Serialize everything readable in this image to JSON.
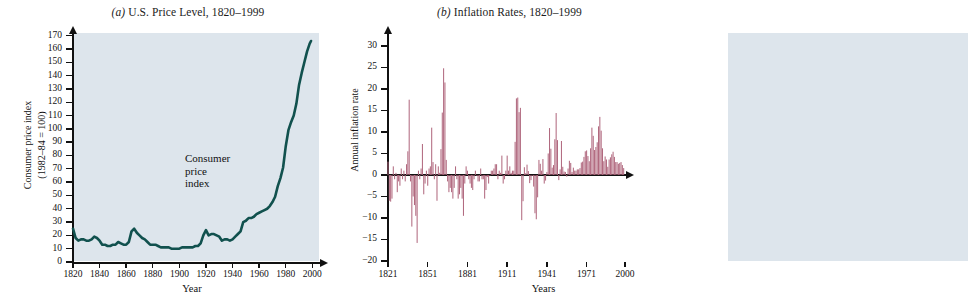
{
  "figure": {
    "panels": [
      {
        "id": "a",
        "label": "(a)",
        "title_italic": "(a)",
        "title_rest": " U.S. Price Level, 1820–1999"
      },
      {
        "id": "b",
        "label": "(b)",
        "title_italic": "(b)",
        "title_rest": " Inflation Rates, 1820–1999"
      }
    ],
    "colors": {
      "plot_background": "#dde5ec",
      "cpi_line": "#11514e",
      "bar_fill": "#b1697f",
      "axis": "#111111",
      "page_background": "#ffffff"
    }
  },
  "chart_data": [
    {
      "type": "line",
      "panel": "a",
      "title": "(a) U.S. Price Level, 1820–1999",
      "xlabel": "Year",
      "ylabel": "Consumer price index (1982–84 = 100)",
      "ylabel_line1": "Consumer price index",
      "ylabel_line2": "(1982–84 = 100)",
      "xlim": [
        1820,
        2005
      ],
      "ylim": [
        0,
        172
      ],
      "yticks": [
        0,
        10,
        20,
        30,
        40,
        50,
        60,
        70,
        80,
        90,
        100,
        110,
        120,
        130,
        140,
        150,
        160,
        170
      ],
      "xticks": [
        1820,
        1840,
        1860,
        1880,
        1900,
        1920,
        1940,
        1960,
        1980,
        2000
      ],
      "grid": false,
      "legend": "none",
      "annotations": [
        {
          "text_line1": "Consumer",
          "text_line2": "price",
          "text_line3": "index",
          "x": 1948,
          "y": 78
        }
      ],
      "series": [
        {
          "name": "Consumer price index",
          "color": "#11514e",
          "x": [
            1820,
            1822,
            1824,
            1826,
            1828,
            1830,
            1832,
            1834,
            1836,
            1838,
            1840,
            1842,
            1844,
            1846,
            1848,
            1850,
            1852,
            1854,
            1856,
            1858,
            1860,
            1862,
            1864,
            1866,
            1868,
            1870,
            1872,
            1874,
            1876,
            1878,
            1880,
            1882,
            1884,
            1886,
            1888,
            1890,
            1892,
            1894,
            1896,
            1898,
            1900,
            1902,
            1904,
            1906,
            1908,
            1910,
            1912,
            1914,
            1916,
            1918,
            1920,
            1922,
            1924,
            1926,
            1928,
            1930,
            1932,
            1934,
            1936,
            1938,
            1940,
            1942,
            1944,
            1946,
            1948,
            1950,
            1952,
            1954,
            1956,
            1958,
            1960,
            1962,
            1964,
            1966,
            1968,
            1970,
            1972,
            1974,
            1976,
            1978,
            1980,
            1982,
            1984,
            1986,
            1988,
            1990,
            1992,
            1994,
            1996,
            1998,
            1999
          ],
          "y": [
            25,
            18,
            16,
            17,
            17,
            16,
            16,
            17,
            19,
            18,
            16,
            13,
            13,
            12,
            12,
            13,
            13,
            15,
            14,
            13,
            13,
            15,
            23,
            25,
            22,
            20,
            18,
            17,
            15,
            13,
            13,
            13,
            12,
            11,
            11,
            11,
            11,
            10,
            10,
            10,
            10,
            11,
            11,
            11,
            11,
            11,
            12,
            12,
            14,
            20,
            24,
            20,
            21,
            21,
            20,
            19,
            16,
            17,
            17,
            16,
            17,
            19,
            21,
            23,
            30,
            31,
            33,
            33,
            34,
            36,
            37,
            38,
            39,
            40,
            42,
            45,
            49,
            57,
            63,
            71,
            87,
            99,
            105,
            110,
            119,
            133,
            142,
            150,
            158,
            164,
            166
          ],
          "note": "CPI 1982–84 = 100, biennial samples"
        }
      ]
    },
    {
      "type": "bar",
      "panel": "b",
      "title": "(b) Inflation Rates, 1820–1999",
      "xlabel": "Years",
      "ylabel": "Annual inflation rate",
      "xlim": [
        1821,
        2000
      ],
      "ylim": [
        -20,
        33
      ],
      "yticks": [
        -20,
        -15,
        -10,
        -5,
        0,
        5,
        10,
        15,
        20,
        25,
        30
      ],
      "xticks": [
        1821,
        1851,
        1881,
        1911,
        1941,
        1971,
        2000
      ],
      "grid": false,
      "legend": "none",
      "bar_color": "#b1697f",
      "years": [
        1821,
        1822,
        1823,
        1824,
        1825,
        1826,
        1827,
        1828,
        1829,
        1830,
        1831,
        1832,
        1833,
        1834,
        1835,
        1836,
        1837,
        1838,
        1839,
        1840,
        1841,
        1842,
        1843,
        1844,
        1845,
        1846,
        1847,
        1848,
        1849,
        1850,
        1851,
        1852,
        1853,
        1854,
        1855,
        1856,
        1857,
        1858,
        1859,
        1860,
        1861,
        1862,
        1863,
        1864,
        1865,
        1866,
        1867,
        1868,
        1869,
        1870,
        1871,
        1872,
        1873,
        1874,
        1875,
        1876,
        1877,
        1878,
        1879,
        1880,
        1881,
        1882,
        1883,
        1884,
        1885,
        1886,
        1887,
        1888,
        1889,
        1890,
        1891,
        1892,
        1893,
        1894,
        1895,
        1896,
        1897,
        1898,
        1899,
        1900,
        1901,
        1902,
        1903,
        1904,
        1905,
        1906,
        1907,
        1908,
        1909,
        1910,
        1911,
        1912,
        1913,
        1914,
        1915,
        1916,
        1917,
        1918,
        1919,
        1920,
        1921,
        1922,
        1923,
        1924,
        1925,
        1926,
        1927,
        1928,
        1929,
        1930,
        1931,
        1932,
        1933,
        1934,
        1935,
        1936,
        1937,
        1938,
        1939,
        1940,
        1941,
        1942,
        1943,
        1944,
        1945,
        1946,
        1947,
        1948,
        1949,
        1950,
        1951,
        1952,
        1953,
        1954,
        1955,
        1956,
        1957,
        1958,
        1959,
        1960,
        1961,
        1962,
        1963,
        1964,
        1965,
        1966,
        1967,
        1968,
        1969,
        1970,
        1971,
        1972,
        1973,
        1974,
        1975,
        1976,
        1977,
        1978,
        1979,
        1980,
        1981,
        1982,
        1983,
        1984,
        1985,
        1986,
        1987,
        1988,
        1989,
        1990,
        1991,
        1992,
        1993,
        1994,
        1995,
        1996,
        1997,
        1998,
        1999
      ],
      "values": [
        3.1,
        -6.0,
        -6.2,
        -5.5,
        2.0,
        -1.0,
        0.5,
        -4.0,
        -1.5,
        -2.5,
        1.5,
        -1.0,
        1.0,
        -1.5,
        2.5,
        5.5,
        17.5,
        -1.5,
        -12.0,
        -5.0,
        -7.0,
        -9.5,
        -15.8,
        1.0,
        -1.0,
        1.5,
        7.2,
        -4.5,
        -2.0,
        1.0,
        -2.5,
        1.5,
        2.0,
        11.0,
        3.0,
        -1.0,
        2.5,
        -6.0,
        2.0,
        0.5,
        6.0,
        14.5,
        24.8,
        21.5,
        3.5,
        -1.5,
        -4.0,
        -3.0,
        -4.0,
        -5.5,
        -3.0,
        2.0,
        -1.0,
        -5.5,
        -4.5,
        -3.0,
        -5.5,
        -9.5,
        -2.0,
        2.0,
        1.0,
        -1.0,
        -2.0,
        -3.0,
        -3.5,
        -1.0,
        1.0,
        0.0,
        -1.5,
        -1.5,
        1.5,
        -1.0,
        -1.0,
        -5.5,
        -3.5,
        -0.5,
        -2.0,
        0.0,
        1.0,
        1.0,
        1.5,
        2.5,
        2.5,
        -1.0,
        1.0,
        0.5,
        4.5,
        -2.0,
        -1.0,
        1.0,
        4.5,
        1.0,
        2.0,
        0.5,
        1.0,
        1.0,
        7.7,
        17.8,
        18.0,
        14.6,
        15.6,
        -10.5,
        -6.1,
        1.8,
        0.4,
        2.4,
        0.9,
        -1.9,
        -1.2,
        0.0,
        -2.7,
        -8.9,
        -10.3,
        -5.2,
        3.5,
        2.6,
        1.0,
        3.7,
        -2.0,
        -1.3,
        0.7,
        5.0,
        10.9,
        6.1,
        1.7,
        2.3,
        8.3,
        14.4,
        8.1,
        -1.2,
        1.3,
        7.9,
        1.9,
        0.8,
        0.7,
        -0.4,
        1.5,
        3.3,
        2.8,
        0.7,
        1.7,
        1.0,
        1.0,
        1.3,
        1.3,
        1.6,
        2.9,
        3.1,
        4.2,
        5.5,
        5.7,
        4.4,
        3.2,
        6.2,
        11.0,
        9.1,
        5.8,
        6.5,
        7.6,
        11.3,
        13.5,
        10.3,
        6.2,
        3.2,
        4.3,
        3.6,
        1.9,
        3.6,
        4.1,
        4.8,
        5.4,
        4.2,
        3.0,
        3.0,
        2.6,
        2.8,
        3.0,
        2.3,
        1.6,
        2.2
      ]
    }
  ]
}
